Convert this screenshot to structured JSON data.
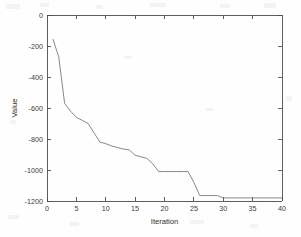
{
  "chart_data": {
    "type": "line",
    "title": "",
    "xlabel": "Iteration",
    "ylabel": "Value",
    "xlim": [
      0,
      40
    ],
    "ylim": [
      -1200,
      0
    ],
    "grid": false,
    "legend": null,
    "xticks": [
      "0",
      "5",
      "10",
      "15",
      "20",
      "25",
      "30",
      "35",
      "40"
    ],
    "xtick_values": [
      0,
      5,
      10,
      15,
      20,
      25,
      30,
      35,
      40
    ],
    "yticks": [
      "0",
      "-200",
      "-400",
      "-600",
      "-800",
      "-1000",
      "-1200"
    ],
    "ytick_values": [
      0,
      -200,
      -400,
      -600,
      -800,
      -1000,
      -1200
    ],
    "line_color": "#7a7a7a",
    "series": [
      {
        "name": "best value",
        "x": [
          1,
          2,
          3,
          4,
          5,
          6,
          7,
          8,
          9,
          10,
          11,
          12,
          13,
          14,
          15,
          16,
          17,
          18,
          19,
          20,
          21,
          22,
          23,
          24,
          25,
          26,
          27,
          28,
          29,
          30,
          31,
          32,
          33,
          34,
          35,
          36,
          37,
          38,
          39,
          40
        ],
        "values": [
          -155,
          -270,
          -570,
          -620,
          -660,
          -680,
          -700,
          -760,
          -820,
          -830,
          -845,
          -855,
          -865,
          -870,
          -905,
          -915,
          -925,
          -960,
          -1010,
          -1010,
          -1010,
          -1010,
          -1010,
          -1010,
          -1080,
          -1165,
          -1165,
          -1165,
          -1165,
          -1180,
          -1180,
          -1180,
          -1180,
          -1180,
          -1180,
          -1180,
          -1180,
          -1180,
          -1180,
          -1180
        ]
      }
    ]
  },
  "axes": {
    "ylabel": "Value",
    "xlabel": "Iteration"
  }
}
